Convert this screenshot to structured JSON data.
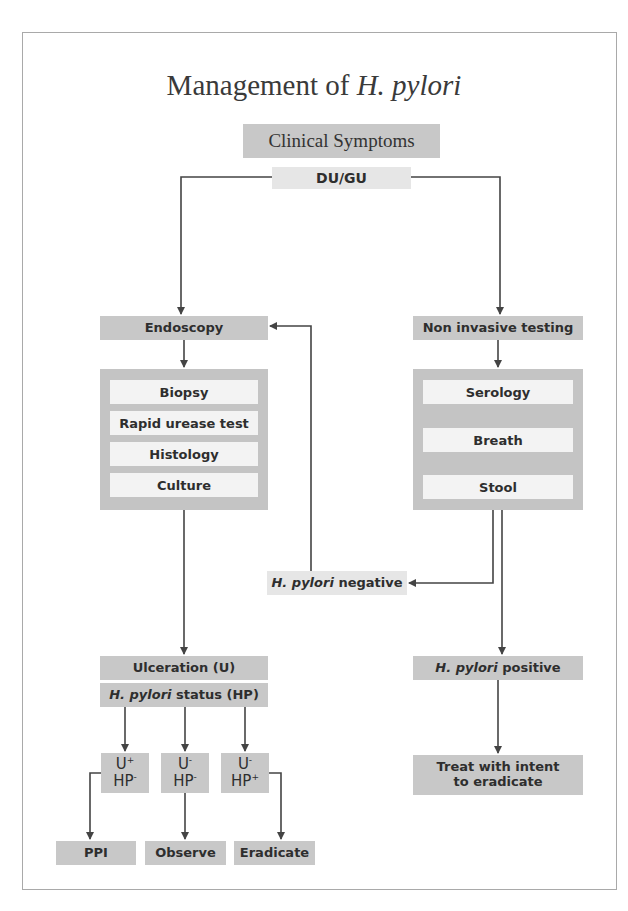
{
  "title": {
    "prefix": "Management of ",
    "italic": "H. pylori"
  },
  "nodes": {
    "clinical_symptoms": "Clinical Symptoms",
    "du_gu": "DU/GU",
    "endoscopy": "Endoscopy",
    "non_invasive": "Non invasive testing",
    "endoscopy_tests": [
      "Biopsy",
      "Rapid urease test",
      "Histology",
      "Culture"
    ],
    "noninvasive_tests": [
      "Serology",
      "Breath",
      "Stool"
    ],
    "hp_negative": {
      "italic": "H. pylori",
      "rest": " negative"
    },
    "hp_positive": {
      "italic": "H. pylori",
      "rest": " positive"
    },
    "ulceration": "Ulceration (U)",
    "hp_status": {
      "italic": "H. pylori",
      "rest": " status (HP)"
    },
    "combos": [
      {
        "u": "U",
        "u_sign": "+",
        "hp": "HP",
        "hp_sign": "-"
      },
      {
        "u": "U",
        "u_sign": "-",
        "hp": "HP",
        "hp_sign": "-"
      },
      {
        "u": "U",
        "u_sign": "-",
        "hp": "HP",
        "hp_sign": "+"
      }
    ],
    "outcomes": [
      "PPI",
      "Observe",
      "Eradicate"
    ],
    "treat": "Treat with intent to eradicate"
  },
  "colors": {
    "box": "#c8c8c8",
    "box_light": "#e6e6e6",
    "inner": "#f3f3f3",
    "line": "#444444",
    "frame": "#a9a9a9"
  }
}
